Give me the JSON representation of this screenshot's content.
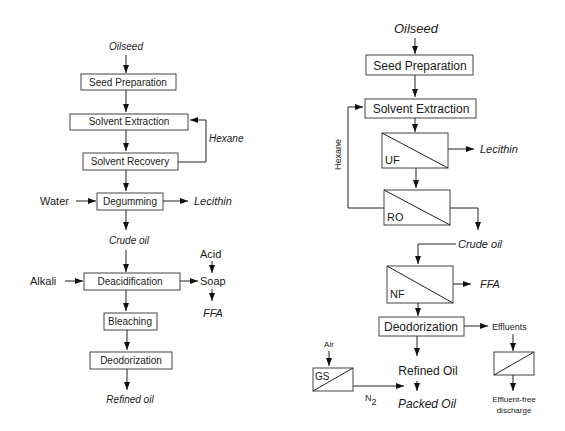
{
  "conventional": {
    "input": "Oilseed",
    "steps": {
      "seed_preparation": "Seed Preparation",
      "solvent_extraction": "Solvent Extraction",
      "solvent_recovery": "Solvent Recovery",
      "degumming": "Degumming",
      "deacidification": "Deacidification",
      "bleaching": "Bleaching",
      "deodorization": "Deodorization"
    },
    "streams": {
      "hexane": "Hexane",
      "water": "Water",
      "lecithin": "Lecithin",
      "crude_oil": "Crude oil",
      "alkali": "Alkali",
      "acid": "Acid",
      "soap": "Soap",
      "ffa": "FFA",
      "refined_oil": "Refined oil"
    }
  },
  "membrane": {
    "input": "Oilseed",
    "steps": {
      "seed_preparation": "Seed Preparation",
      "solvent_extraction": "Solvent Extraction",
      "uf": "UF",
      "ro": "RO",
      "nf": "NF",
      "deodorization": "Deodorization",
      "gs": "GS"
    },
    "streams": {
      "hexane": "Hexane",
      "lecithin": "Lecithin",
      "crude_oil": "Crude oil",
      "ffa": "FFA",
      "effluents": "Effluents",
      "air": "Air",
      "n2_base": "N",
      "n2_sub": "2",
      "refined_oil": "Refined Oil",
      "packed_oil": "Packed Oil",
      "effluent_free_1": "Effluent-free",
      "effluent_free_2": "discharge"
    }
  }
}
